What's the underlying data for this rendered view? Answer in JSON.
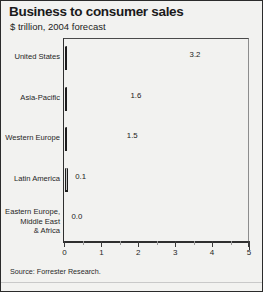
{
  "header": {
    "title": "Business to consumer sales",
    "subtitle": "$ trillion, 2004 forecast"
  },
  "source": "Source: Forrester Research.",
  "colors": {
    "bar_fill": "#b2b2b2",
    "bar_edge": "#1c1c1c",
    "panel_bg": "#f2f2f0",
    "panel_border": "#2b2b2b",
    "text": "#1a1a1a"
  },
  "chart_data": {
    "type": "bar",
    "orientation": "horizontal",
    "title": "Business to consumer sales",
    "subtitle": "$ trillion, 2004 forecast",
    "xlabel": "",
    "ylabel": "",
    "xlim": [
      0,
      5
    ],
    "grid": false,
    "legend": false,
    "xticks": [
      0,
      1,
      2,
      3,
      4,
      5
    ],
    "xtick_labels": [
      "0",
      "1",
      "2",
      "3",
      "4",
      "5"
    ],
    "categories": [
      "United States",
      "Asia-Pacific",
      "Western Europe",
      "Latin America",
      "Eastern Europe, Middle East & Africa"
    ],
    "category_labels": [
      [
        "United States"
      ],
      [
        "Asia-Pacific"
      ],
      [
        "Western Europe"
      ],
      [
        "Latin America"
      ],
      [
        "Eastern Europe,",
        "Middle East",
        "& Africa"
      ]
    ],
    "values": [
      3.2,
      1.6,
      1.5,
      0.1,
      0.0
    ],
    "data_labels": [
      "3.2",
      "1.6",
      "1.5",
      "0.1",
      "0.0"
    ],
    "source": "Source: Forrester Research."
  }
}
